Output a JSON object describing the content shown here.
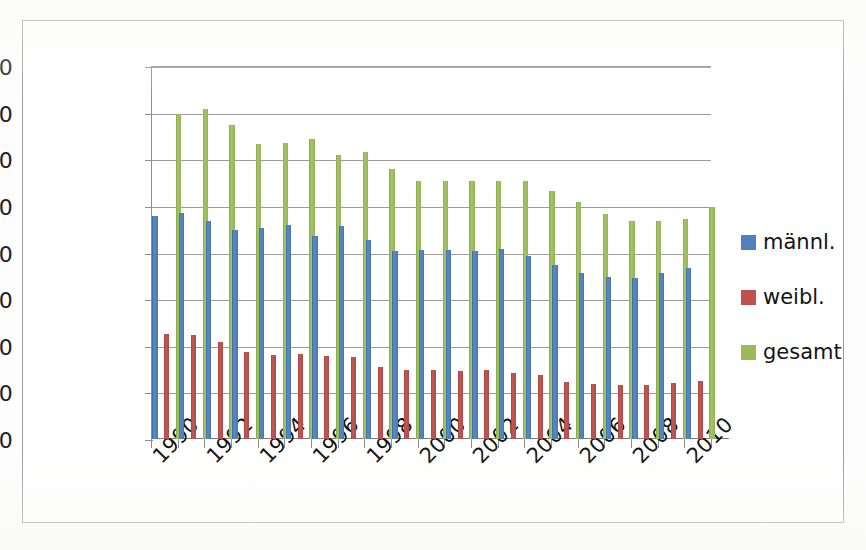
{
  "chart_data": {
    "type": "bar",
    "title": "",
    "subtitle": "",
    "xlabel": "",
    "ylabel": "",
    "ylim": [
      0,
      16000
    ],
    "ytick_step": 2000,
    "yticks": [
      "16000",
      "14000",
      "12000",
      "10000",
      "8000",
      "6000",
      "4000",
      "2000",
      "0"
    ],
    "grid": true,
    "legend_position": "right",
    "categories": [
      "1990",
      "1991",
      "1992",
      "1993",
      "1994",
      "1995",
      "1996",
      "1997",
      "1998",
      "1999",
      "2000",
      "2001",
      "2002",
      "2003",
      "2004",
      "2005",
      "2006",
      "2007",
      "2008",
      "2009",
      "2010"
    ],
    "xtick_labels": [
      "1990",
      "1992",
      "1994",
      "1996",
      "1998",
      "2000",
      "2002",
      "2004",
      "2006",
      "2008",
      "2010"
    ],
    "series": [
      {
        "name": "männl.",
        "color": "#4f81bd",
        "values": [
          9550,
          9700,
          9350,
          8950,
          9050,
          9200,
          8700,
          9150,
          8550,
          8050,
          8100,
          8100,
          8050,
          8150,
          7850,
          7450,
          7100,
          6950,
          6900,
          7100,
          7350
        ]
      },
      {
        "name": "weibl.",
        "color": "#c0504d",
        "values": [
          4500,
          4450,
          4150,
          3750,
          3600,
          3650,
          3550,
          3500,
          3100,
          2950,
          2950,
          2900,
          2950,
          2850,
          2750,
          2450,
          2350,
          2300,
          2300,
          2400,
          2500
        ]
      },
      {
        "name": "gesamt",
        "color": "#9bbb59",
        "values": [
          13950,
          14150,
          13450,
          12650,
          12700,
          12850,
          12200,
          12300,
          11600,
          11050,
          11050,
          11050,
          11050,
          11050,
          10650,
          10150,
          9650,
          9350,
          9350,
          9450,
          9950
        ]
      }
    ]
  },
  "legend": {
    "items": [
      {
        "label": "männl.",
        "color": "#4f81bd"
      },
      {
        "label": "weibl.",
        "color": "#c0504d"
      },
      {
        "label": "gesamt",
        "color": "#9bbb59"
      }
    ]
  },
  "caption": {
    "text": ""
  }
}
